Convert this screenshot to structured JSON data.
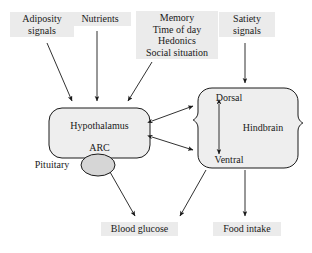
{
  "diagram": {
    "type": "flow-diagram",
    "inputs": [
      {
        "id": "adiposity",
        "label": "Adiposity\nsignals",
        "line1": "Adiposity",
        "line2": "signals",
        "target": "hypothalamus"
      },
      {
        "id": "nutrients",
        "label": "Nutrients",
        "line1": "Nutrients",
        "line2": "",
        "target": "hypothalamus"
      },
      {
        "id": "cognitive",
        "line1": "Memory",
        "line2": "Time of day",
        "line3": "Hedonics",
        "line4": "Social situation",
        "target": "hypothalamus"
      },
      {
        "id": "satiety",
        "line1": "Satiety",
        "line2": "signals",
        "target": "hindbrain"
      }
    ],
    "nodes": [
      {
        "id": "hypothalamus",
        "label": "Hypothalamus",
        "sublabel": "ARC",
        "shape": "rounded-rect",
        "fill": "#eeeeee"
      },
      {
        "id": "pituitary",
        "label": "Pituitary",
        "shape": "ellipse",
        "fill": "#d6d6d6"
      },
      {
        "id": "hindbrain",
        "label": "Hindbrain",
        "top_label": "Dorsal",
        "bottom_label": "Ventral",
        "shape": "lobed-rect",
        "fill": "#eeeeee"
      }
    ],
    "outputs": [
      {
        "id": "blood-glucose",
        "label": "Blood glucose"
      },
      {
        "id": "food-intake",
        "label": "Food intake"
      }
    ],
    "connections": [
      {
        "from": "adiposity",
        "to": "hypothalamus",
        "direction": "one-way"
      },
      {
        "from": "nutrients",
        "to": "hypothalamus",
        "direction": "one-way"
      },
      {
        "from": "cognitive",
        "to": "hypothalamus",
        "direction": "one-way"
      },
      {
        "from": "satiety",
        "to": "hindbrain",
        "direction": "one-way"
      },
      {
        "from": "hypothalamus",
        "to": "hindbrain",
        "direction": "two-way",
        "position": "upper"
      },
      {
        "from": "hypothalamus",
        "to": "hindbrain",
        "direction": "two-way",
        "position": "lower"
      },
      {
        "from": "dorsal",
        "to": "ventral",
        "direction": "two-way"
      },
      {
        "from": "pituitary",
        "to": "blood-glucose",
        "direction": "one-way"
      },
      {
        "from": "hindbrain",
        "to": "blood-glucose",
        "direction": "one-way"
      },
      {
        "from": "hindbrain",
        "to": "food-intake",
        "direction": "one-way"
      }
    ],
    "colors": {
      "stroke": "#1a1a1a",
      "node_fill": "#eeeeee",
      "pituitary_fill": "#d6d6d6",
      "label_tint": "#ebebeb",
      "background": "#ffffff"
    }
  }
}
